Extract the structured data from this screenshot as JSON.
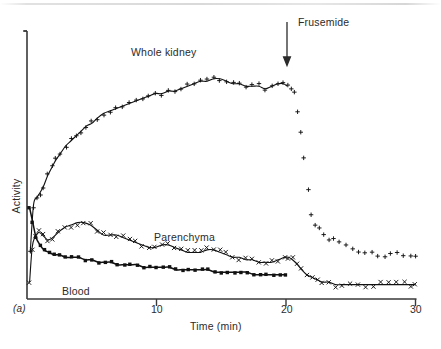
{
  "figure": {
    "panel_letter": "(a)",
    "background": "#ffffff",
    "ink": "#1a1a1a"
  },
  "annotations": {
    "frusemide": {
      "text": "Frusemide",
      "arrow_time_min": 20,
      "arrow_icon": "down-arrow-icon"
    }
  },
  "series_labels": {
    "whole_kidney": "Whole kidney",
    "parenchyma": "Parenchyma",
    "blood": "Blood"
  },
  "chart_data": {
    "type": "line",
    "title": "",
    "subtitle": "",
    "xlabel": "Time (min)",
    "ylabel": "Activity",
    "xlim": [
      0,
      30
    ],
    "ylim": [
      0,
      100
    ],
    "xticks": [
      10,
      20,
      30
    ],
    "xticklabels": [
      "10",
      "20",
      "30"
    ],
    "yticks": [],
    "yticklabels": [],
    "grid": false,
    "legend_position": "inline-annotations",
    "annotations": [
      {
        "text": "Frusemide",
        "x": 20,
        "y": 100,
        "type": "arrow-down"
      },
      {
        "text": "Whole kidney",
        "x": 10,
        "y": 88
      },
      {
        "text": "Parenchyma",
        "x": 14.3,
        "y": 27
      },
      {
        "text": "Blood",
        "x": 2.7,
        "y": 8
      }
    ],
    "series": [
      {
        "name": "Whole kidney",
        "marker": "plus",
        "line": true,
        "x": [
          0.25,
          0.5,
          0.75,
          1,
          1.3,
          1.6,
          1.9,
          2.2,
          2.6,
          3,
          3.4,
          3.8,
          4.2,
          4.6,
          5,
          5.4,
          5.9,
          6.4,
          6.9,
          7.4,
          7.9,
          8.4,
          8.9,
          9.4,
          9.9,
          10.4,
          10.9,
          11.4,
          11.9,
          12.4,
          12.9,
          13.4,
          13.9,
          14.4,
          14.9,
          15.4,
          15.9,
          16.4,
          16.9,
          17.4,
          17.9,
          18.4,
          18.9,
          19.4,
          19.8,
          20.1,
          20.4,
          20.6,
          20.9,
          21.1,
          21.4,
          21.7,
          22,
          22.3,
          22.6,
          22.9,
          23.3,
          23.7,
          24.1,
          24.6,
          25.1,
          25.6,
          26.1,
          26.6,
          27.1,
          27.6,
          28.1,
          28.6,
          29.1,
          29.6,
          30
        ],
        "y": [
          18,
          37,
          40,
          42,
          45,
          49,
          52,
          55,
          58,
          61,
          63,
          65,
          67,
          69,
          70,
          72,
          74,
          75,
          76,
          77,
          78,
          79,
          80,
          81,
          82,
          82,
          83,
          83,
          84,
          85,
          86,
          87,
          87,
          88,
          88,
          87,
          86,
          86,
          85,
          85,
          85,
          84,
          85,
          86,
          86,
          85,
          83,
          83,
          74,
          66,
          56,
          43,
          33,
          30,
          28,
          26,
          24,
          23,
          22,
          21,
          20,
          19,
          18,
          18,
          17,
          17,
          17,
          17,
          17,
          16,
          16
        ]
      },
      {
        "name": "Parenchyma",
        "marker": "cross",
        "line": true,
        "x": [
          0.2,
          0.4,
          0.6,
          0.9,
          1.2,
          1.6,
          2,
          2.4,
          2.9,
          3.4,
          3.9,
          4.4,
          4.9,
          5.4,
          5.9,
          6.4,
          6.9,
          7.4,
          7.9,
          8.4,
          8.9,
          9.4,
          9.9,
          10.4,
          10.9,
          11.4,
          11.9,
          12.4,
          12.9,
          13.4,
          13.9,
          14.4,
          14.9,
          15.4,
          15.9,
          16.4,
          16.9,
          17.4,
          17.9,
          18.4,
          18.9,
          19.4,
          19.9,
          20.2,
          20.5,
          20.9,
          21.2,
          21.6,
          22,
          22.4,
          22.8,
          23.3,
          23.8,
          24.3,
          24.9,
          25.5,
          26.1,
          26.7,
          27.3,
          27.9,
          28.5,
          29.1,
          29.6,
          30
        ],
        "y": [
          6,
          20,
          24,
          26,
          25,
          23,
          24,
          26,
          28,
          29,
          30,
          30,
          29,
          27,
          25,
          25,
          25,
          24,
          23,
          22,
          21,
          20,
          20,
          21,
          21,
          20,
          19,
          18,
          18,
          18,
          19,
          19,
          18,
          17,
          16,
          16,
          15,
          15,
          14,
          14,
          14,
          15,
          16,
          16,
          15,
          13,
          11,
          9,
          8,
          7,
          6,
          6,
          5,
          5,
          5,
          5,
          5,
          5,
          5,
          5,
          5,
          5,
          5,
          5
        ]
      },
      {
        "name": "Blood",
        "marker": "square",
        "line": true,
        "x": [
          0.2,
          0.45,
          0.7,
          1,
          1.3,
          1.7,
          2.1,
          2.5,
          3,
          3.5,
          4,
          4.5,
          5,
          5.5,
          6,
          6.5,
          7,
          7.5,
          8,
          8.5,
          9,
          9.5,
          10,
          10.5,
          11,
          11.5,
          12,
          12.5,
          13,
          13.5,
          14,
          14.5,
          15,
          15.5,
          16,
          16.5,
          17,
          17.5,
          18,
          18.5,
          19,
          19.5,
          20
        ],
        "y": [
          36,
          30,
          24,
          21,
          19,
          18,
          17,
          17,
          16,
          16,
          16,
          15,
          15,
          14,
          14,
          14,
          13,
          13,
          13,
          13,
          12,
          12,
          12,
          12,
          12,
          11,
          11,
          11,
          11,
          11,
          11,
          10,
          10,
          10,
          10,
          10,
          10,
          9,
          9,
          9,
          9,
          9,
          9
        ]
      }
    ]
  }
}
